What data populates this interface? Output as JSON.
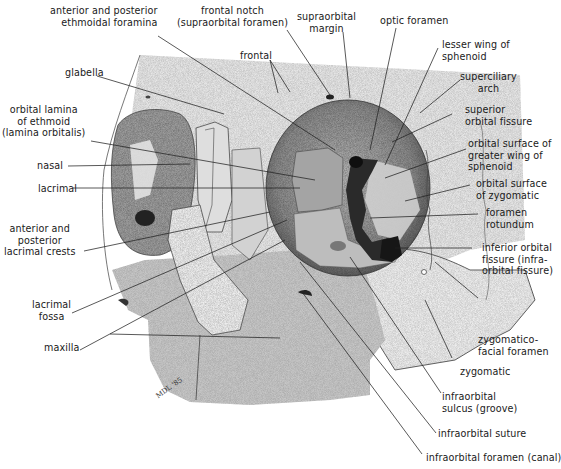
{
  "figure": {
    "signature": "MDL '85",
    "colors": {
      "bone_light": "#e2e2e2",
      "bone_mid": "#c4c4c4",
      "bone_dark": "#8f8f8f",
      "orbit_shadow": "#5a5a5a",
      "foramen": "#1c1c1c",
      "line": "#222222",
      "text": "#1a1a1a"
    }
  },
  "labels": {
    "ethmoidal_foramina": "anterior and posterior\nethmoidal foramina",
    "frontal_notch": "frontal notch\n(supraorbital foramen)",
    "supraorbital_margin": "supraorbital\nmargin",
    "optic_foramen": "optic foramen",
    "frontal": "frontal",
    "lesser_wing": "lesser wing of\nsphenoid",
    "glabella": "glabella",
    "superciliary_arch": "superciliary\narch",
    "superior_orbital_fissure": "superior\norbital fissure",
    "orbital_lamina": "orbital lamina\nof ethmoid\n(lamina orbitalis)",
    "greater_wing": "orbital surface of\ngreater wing of\nsphenoid",
    "nasal": "nasal",
    "zygomatic_orbital": "orbital surface\nof zygomatic",
    "lacrimal": "lacrimal",
    "foramen_rotundum": "foramen\nrotundum",
    "lacrimal_crests": "anterior and\nposterior\nlacrimal crests",
    "inferior_orbital_fissure": "inferior orbital\nfissure (infra-\norbital fissure)",
    "lacrimal_fossa": "lacrimal\nfossa",
    "maxilla": "maxilla",
    "zygomaticofacial_foramen": "zygomatico-\nfacial foramen",
    "zygomatic": "zygomatic",
    "infraorbital_sulcus": "infraorbital\nsulcus (groove)",
    "infraorbital_suture": "infraorbital suture",
    "infraorbital_foramen": "infraorbital foramen (canal)"
  }
}
